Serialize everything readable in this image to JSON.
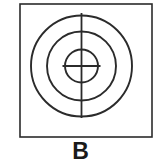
{
  "figure": {
    "label": "B",
    "caption_label": "B",
    "background_color": "#ffffff",
    "stroke_color": "#2b2b2b",
    "label_color": "#1a1a1a",
    "canvas": {
      "width": 161,
      "height": 164
    },
    "frame": {
      "name": "outer-rectangle",
      "x": 20,
      "y": 4,
      "width": 132,
      "height": 133,
      "stroke_width": 1.6
    },
    "target_symbol": {
      "center_x": 81.5,
      "center_y": 66,
      "circles": [
        {
          "name": "outer-circle",
          "radius": 50.5,
          "stroke_width": 1.9
        },
        {
          "name": "middle-circle",
          "radius": 34.5,
          "stroke_width": 1.9
        },
        {
          "name": "inner-circle",
          "radius": 16.5,
          "stroke_width": 1.9
        }
      ],
      "crosshair": {
        "vertical_line": {
          "x": 81.5,
          "y1": 13,
          "y2": 118,
          "stroke_width": 1.8
        },
        "horizontal_line": {
          "y": 66,
          "x1": 62.5,
          "x2": 100.5,
          "stroke_width": 1.8
        }
      }
    }
  }
}
